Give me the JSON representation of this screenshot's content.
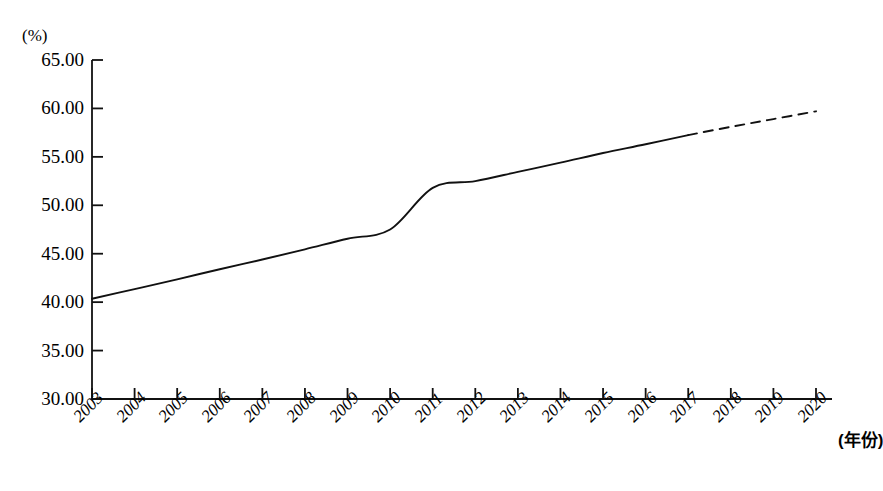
{
  "chart_data": {
    "type": "line",
    "title": "",
    "subtitle": "",
    "xlabel": "(年份)",
    "ylabel": "(%)",
    "ylim": [
      30.0,
      65.0
    ],
    "xlim": [
      2003,
      2020
    ],
    "grid": false,
    "legend": "none",
    "y_ticks": [
      "65.00",
      "60.00",
      "55.00",
      "50.00",
      "45.00",
      "40.00",
      "35.00",
      "30.00"
    ],
    "y_tick_values": [
      65.0,
      60.0,
      55.0,
      50.0,
      45.0,
      40.0,
      35.0,
      30.0
    ],
    "categories": [
      "2003",
      "2004",
      "2005",
      "2006",
      "2007",
      "2008",
      "2009",
      "2010",
      "2011",
      "2012",
      "2013",
      "2014",
      "2015",
      "2016",
      "2017",
      "2018",
      "2019",
      "2020"
    ],
    "x": [
      2003,
      2004,
      2005,
      2006,
      2007,
      2008,
      2009,
      2010,
      2011,
      2012,
      2013,
      2014,
      2015,
      2016,
      2017,
      2018,
      2019,
      2020
    ],
    "series": [
      {
        "name": "actual",
        "style": "solid",
        "x": [
          2003,
          2004,
          2005,
          2006,
          2007,
          2008,
          2009,
          2010,
          2011,
          2012,
          2013,
          2014,
          2015,
          2016,
          2017
        ],
        "values": [
          40.35,
          41.35,
          42.35,
          43.4,
          44.4,
          45.45,
          46.55,
          47.5,
          51.8,
          52.5,
          53.45,
          54.4,
          55.4,
          56.3,
          57.25
        ]
      },
      {
        "name": "forecast",
        "style": "dashed",
        "x": [
          2017,
          2018,
          2019,
          2020
        ],
        "values": [
          57.25,
          58.1,
          58.9,
          59.7
        ]
      }
    ]
  },
  "axes": {
    "y_unit_label": "(%)",
    "x_axis_label": "(年份)"
  }
}
